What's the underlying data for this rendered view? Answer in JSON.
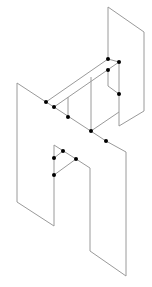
{
  "diagram": {
    "type": "isometric-line-drawing",
    "colors": {
      "line": "#9a9a9a",
      "dot": "#000000",
      "background": "#ffffff"
    },
    "lines": [
      [
        108,
        7,
        144,
        32
      ],
      [
        144,
        32,
        144,
        111
      ],
      [
        108,
        7,
        108,
        59
      ],
      [
        17,
        83,
        46,
        102
      ],
      [
        17,
        83,
        17,
        202
      ],
      [
        17,
        202,
        54,
        226
      ],
      [
        46,
        102,
        108,
        59
      ],
      [
        54,
        107,
        119,
        62
      ],
      [
        46,
        102,
        54,
        107
      ],
      [
        54,
        107,
        106,
        141
      ],
      [
        106,
        141,
        126,
        152
      ],
      [
        126,
        152,
        126,
        276
      ],
      [
        90,
        251,
        126,
        276
      ],
      [
        90,
        168,
        90,
        251
      ],
      [
        108,
        70,
        108,
        86
      ],
      [
        108,
        86,
        119,
        94
      ],
      [
        119,
        62,
        119,
        126
      ],
      [
        68,
        117,
        68,
        97
      ],
      [
        91,
        131,
        91,
        77
      ],
      [
        91,
        131,
        119,
        112
      ],
      [
        119,
        126,
        144,
        111
      ],
      [
        54,
        145,
        54,
        226
      ],
      [
        54,
        145,
        76,
        159
      ],
      [
        76,
        159,
        90,
        168
      ],
      [
        54,
        158,
        63,
        151
      ],
      [
        54,
        175,
        76,
        159
      ],
      [
        108,
        59,
        119,
        62
      ]
    ],
    "dots": [
      [
        108,
        59
      ],
      [
        119,
        62
      ],
      [
        108,
        70
      ],
      [
        119,
        94
      ],
      [
        46,
        102
      ],
      [
        54,
        107
      ],
      [
        68,
        117
      ],
      [
        91,
        131
      ],
      [
        106,
        141
      ],
      [
        63,
        151
      ],
      [
        54,
        158
      ],
      [
        76,
        159
      ],
      [
        54,
        175
      ]
    ]
  }
}
